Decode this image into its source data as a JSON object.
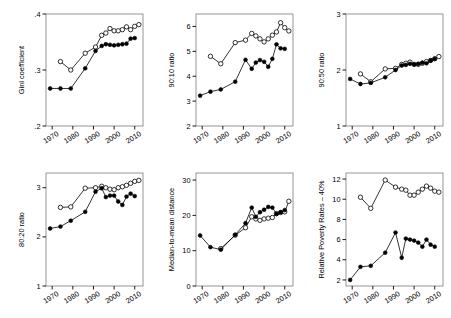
{
  "figure": {
    "background": "#ffffff",
    "line_color": "#000000",
    "marker_filled_color": "#000000",
    "marker_open_color": "#ffffff",
    "panel_count": 6
  },
  "chart_data": [
    {
      "type": "line",
      "title": "",
      "xlabel": "",
      "ylabel": "Gini coefficient",
      "xlim": [
        1967,
        2014
      ],
      "ylim": [
        0.2,
        0.4
      ],
      "xticks": [
        1970,
        1980,
        1990,
        2000,
        2010
      ],
      "xticklabels": [
        "1970",
        "1980",
        "1990",
        "2000",
        "2010"
      ],
      "yticks": [
        0.2,
        0.3,
        0.4
      ],
      "yticklabels": [
        ".2",
        ".3",
        ".4"
      ],
      "grid": false,
      "legend": "none",
      "series": [
        {
          "name": "open-circle-series",
          "marker": "open-circle",
          "x": [
            1974,
            1979,
            1986,
            1991,
            1994,
            1996,
            1998,
            2000,
            2002,
            2004,
            2006,
            2008,
            2010,
            2012
          ],
          "values": [
            0.315,
            0.3,
            0.33,
            0.341,
            0.362,
            0.366,
            0.374,
            0.37,
            0.37,
            0.372,
            0.377,
            0.372,
            0.378,
            0.381
          ]
        },
        {
          "name": "filled-circle-series",
          "marker": "filled-circle",
          "x": [
            1969,
            1974,
            1979,
            1986,
            1991,
            1994,
            1996,
            1998,
            2000,
            2002,
            2004,
            2006,
            2008,
            2010
          ],
          "values": [
            0.267,
            0.267,
            0.267,
            0.303,
            0.334,
            0.343,
            0.346,
            0.345,
            0.344,
            0.345,
            0.346,
            0.347,
            0.356,
            0.357
          ]
        }
      ]
    },
    {
      "type": "line",
      "title": "",
      "xlabel": "",
      "ylabel": "90:10 ratio",
      "xlim": [
        1967,
        2014
      ],
      "ylim": [
        2,
        6.5
      ],
      "xticks": [
        1970,
        1980,
        1990,
        2000,
        2010
      ],
      "xticklabels": [
        "1970",
        "1980",
        "1990",
        "2000",
        "2010"
      ],
      "yticks": [
        2,
        3,
        4,
        5,
        6
      ],
      "yticklabels": [
        "2",
        "3",
        "4",
        "5",
        "6"
      ],
      "grid": false,
      "legend": "none",
      "series": [
        {
          "name": "open-circle-series",
          "marker": "open-circle",
          "x": [
            1974,
            1979,
            1986,
            1991,
            1994,
            1996,
            1998,
            2000,
            2002,
            2004,
            2006,
            2008,
            2010,
            2012
          ],
          "values": [
            4.8,
            4.5,
            5.35,
            5.45,
            5.72,
            5.62,
            5.5,
            5.38,
            5.5,
            5.65,
            5.78,
            6.15,
            5.95,
            5.82
          ]
        },
        {
          "name": "filled-circle-series",
          "marker": "filled-circle",
          "x": [
            1969,
            1974,
            1979,
            1986,
            1991,
            1994,
            1996,
            1998,
            2000,
            2002,
            2004,
            2006,
            2008,
            2010
          ],
          "values": [
            3.22,
            3.38,
            3.47,
            3.78,
            4.66,
            4.3,
            4.55,
            4.65,
            4.58,
            4.38,
            4.7,
            5.28,
            5.12,
            5.1
          ]
        }
      ]
    },
    {
      "type": "line",
      "title": "",
      "xlabel": "",
      "ylabel": "90:50 ratio",
      "xlim": [
        1967,
        2014
      ],
      "ylim": [
        1,
        3
      ],
      "xticks": [
        1970,
        1980,
        1990,
        2000,
        2010
      ],
      "xticklabels": [
        "1970",
        "1980",
        "1990",
        "2000",
        "2010"
      ],
      "yticks": [
        1,
        2,
        3
      ],
      "yticklabels": [
        "1",
        "2",
        "3"
      ],
      "grid": false,
      "legend": "none",
      "series": [
        {
          "name": "open-circle-series",
          "marker": "open-circle",
          "x": [
            1974,
            1979,
            1986,
            1991,
            1994,
            1996,
            1998,
            2000,
            2002,
            2004,
            2006,
            2008,
            2010,
            2012
          ],
          "values": [
            1.93,
            1.79,
            2.02,
            2.03,
            2.1,
            2.12,
            2.14,
            2.1,
            2.1,
            2.12,
            2.15,
            2.17,
            2.2,
            2.24
          ]
        },
        {
          "name": "filled-circle-series",
          "marker": "filled-circle",
          "x": [
            1969,
            1974,
            1979,
            1986,
            1991,
            1994,
            1996,
            1998,
            2000,
            2002,
            2004,
            2006,
            2008,
            2010
          ],
          "values": [
            1.84,
            1.75,
            1.77,
            1.87,
            2.0,
            2.08,
            2.09,
            2.11,
            2.1,
            2.11,
            2.13,
            2.12,
            2.17,
            2.2
          ]
        }
      ]
    },
    {
      "type": "line",
      "title": "",
      "xlabel": "",
      "ylabel": "80:20 ratio",
      "xlim": [
        1967,
        2014
      ],
      "ylim": [
        1,
        3.3
      ],
      "xticks": [
        1970,
        1980,
        1990,
        2000,
        2010
      ],
      "xticklabels": [
        "1970",
        "1980",
        "1990",
        "2000",
        "2010"
      ],
      "yticks": [
        1,
        2,
        3
      ],
      "yticklabels": [
        "1",
        "2",
        "3"
      ],
      "grid": false,
      "legend": "none",
      "series": [
        {
          "name": "open-circle-series",
          "marker": "open-circle",
          "x": [
            1974,
            1979,
            1986,
            1991,
            1994,
            1996,
            1998,
            2000,
            2002,
            2004,
            2006,
            2008,
            2010,
            2012
          ],
          "values": [
            2.6,
            2.61,
            2.99,
            3.0,
            3.03,
            3.0,
            2.97,
            2.96,
            3.0,
            3.02,
            3.05,
            3.09,
            3.13,
            3.15
          ]
        },
        {
          "name": "filled-circle-series",
          "marker": "filled-circle",
          "x": [
            1969,
            1974,
            1979,
            1986,
            1991,
            1994,
            1996,
            1998,
            2000,
            2002,
            2004,
            2006,
            2008,
            2010
          ],
          "values": [
            2.17,
            2.21,
            2.33,
            2.51,
            2.92,
            2.99,
            2.81,
            2.84,
            2.84,
            2.72,
            2.65,
            2.82,
            2.88,
            2.83
          ]
        }
      ]
    },
    {
      "type": "line",
      "title": "",
      "xlabel": "",
      "ylabel": "Median-to-mean distance",
      "xlim": [
        1967,
        2014
      ],
      "ylim": [
        0,
        32
      ],
      "xticks": [
        1970,
        1980,
        1990,
        2000,
        2010
      ],
      "xticklabels": [
        "1970",
        "1980",
        "1990",
        "2000",
        "2010"
      ],
      "yticks": [
        0,
        10,
        20,
        30
      ],
      "yticklabels": [
        "0",
        "10",
        "20",
        "30"
      ],
      "grid": false,
      "legend": "none",
      "series": [
        {
          "name": "open-circle-series",
          "marker": "open-circle",
          "x": [
            1979,
            1986,
            1991,
            1994,
            1996,
            1998,
            2000,
            2002,
            2004,
            2006,
            2008,
            2010,
            2012
          ],
          "values": [
            10.6,
            14.4,
            16.5,
            19.6,
            19.0,
            18.6,
            19.0,
            19.2,
            19.4,
            20.5,
            20.8,
            21.0,
            24.0
          ]
        },
        {
          "name": "filled-circle-series",
          "marker": "filled-circle",
          "x": [
            1969,
            1974,
            1979,
            1986,
            1991,
            1994,
            1996,
            1998,
            2000,
            2002,
            2004,
            2006,
            2008,
            2010
          ],
          "values": [
            14.3,
            11.0,
            10.3,
            14.5,
            17.8,
            22.2,
            19.6,
            20.9,
            21.6,
            22.4,
            22.2,
            20.4,
            20.9,
            21.5
          ]
        }
      ]
    },
    {
      "type": "line",
      "title": "",
      "xlabel": "",
      "ylabel": "Relative Poverty Rates – 40%",
      "xlim": [
        1967,
        2014
      ],
      "ylim": [
        1.4,
        12.6
      ],
      "xticks": [
        1970,
        1980,
        1990,
        2000,
        2010
      ],
      "xticklabels": [
        "1970",
        "1980",
        "1990",
        "2000",
        "2010"
      ],
      "yticks": [
        2,
        4,
        6,
        8,
        10,
        12
      ],
      "yticklabels": [
        "2",
        "4",
        "6",
        "8",
        "10",
        "12"
      ],
      "grid": false,
      "legend": "none",
      "series": [
        {
          "name": "open-circle-series",
          "marker": "open-circle",
          "x": [
            1974,
            1979,
            1986,
            1991,
            1994,
            1996,
            1998,
            2000,
            2002,
            2004,
            2006,
            2008,
            2010,
            2012
          ],
          "values": [
            10.2,
            9.1,
            11.9,
            11.2,
            11.0,
            10.9,
            10.4,
            10.4,
            10.7,
            11.0,
            11.3,
            11.1,
            10.8,
            10.7
          ]
        },
        {
          "name": "filled-circle-series",
          "marker": "filled-circle",
          "x": [
            1969,
            1974,
            1979,
            1986,
            1991,
            1994,
            1996,
            1998,
            2000,
            2002,
            2004,
            2006,
            2008,
            2010
          ],
          "values": [
            2.0,
            3.3,
            3.4,
            4.7,
            6.7,
            4.2,
            6.1,
            6.0,
            5.9,
            5.7,
            5.3,
            6.0,
            5.5,
            5.3
          ]
        }
      ]
    }
  ],
  "panels": [
    {
      "name": "gini-coefficient-panel",
      "ylabel": "Gini coefficient"
    },
    {
      "name": "ratio-90-10-panel",
      "ylabel": "90:10 ratio"
    },
    {
      "name": "ratio-90-50-panel",
      "ylabel": "90:50 ratio"
    },
    {
      "name": "ratio-80-20-panel",
      "ylabel": "80:20 ratio"
    },
    {
      "name": "median-to-mean-panel",
      "ylabel": "Median-to-mean distance"
    },
    {
      "name": "relative-poverty-panel",
      "ylabel": "Relative Poverty Rates – 40%"
    }
  ]
}
